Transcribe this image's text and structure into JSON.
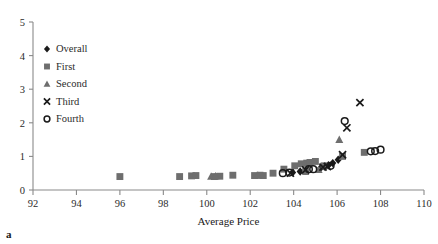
{
  "figure": {
    "panel_label": "a",
    "background_color": "#ffffff"
  },
  "chart_data": {
    "type": "scatter",
    "title": "",
    "xlabel": "Average Price",
    "ylabel": "",
    "xlim": [
      92,
      110
    ],
    "ylim": [
      0,
      5
    ],
    "x_ticks": [
      "92",
      "94",
      "96",
      "98",
      "100",
      "102",
      "104",
      "106",
      "108",
      "110"
    ],
    "x_tick_values": [
      92,
      94,
      96,
      98,
      100,
      102,
      104,
      106,
      108,
      110
    ],
    "y_ticks": [
      "0",
      "1",
      "2",
      "3",
      "4",
      "5"
    ],
    "y_tick_values": [
      0,
      1,
      2,
      3,
      4,
      5
    ],
    "grid": false,
    "legend_position": "upper-left-inside",
    "marker_colors": {
      "overall": "#1a1a1a",
      "first": "#6e6e6e",
      "second": "#6e6e6e",
      "third": "#1a1a1a",
      "fourth": "#1a1a1a"
    },
    "series": [
      {
        "name": "Overall",
        "marker": "diamond",
        "color": "#1a1a1a",
        "points": [
          [
            103.95,
            0.52
          ],
          [
            104.3,
            0.55
          ],
          [
            104.55,
            0.58
          ],
          [
            105.25,
            0.66
          ],
          [
            105.45,
            0.7
          ],
          [
            105.6,
            0.74
          ],
          [
            105.8,
            0.8
          ],
          [
            106.05,
            0.9
          ]
        ]
      },
      {
        "name": "First",
        "marker": "square",
        "color": "#6e6e6e",
        "points": [
          [
            96.0,
            0.4
          ],
          [
            98.75,
            0.4
          ],
          [
            99.3,
            0.42
          ],
          [
            99.5,
            0.43
          ],
          [
            100.35,
            0.4
          ],
          [
            100.6,
            0.41
          ],
          [
            101.2,
            0.44
          ],
          [
            102.2,
            0.43
          ],
          [
            102.45,
            0.44
          ],
          [
            102.6,
            0.43
          ],
          [
            103.05,
            0.5
          ],
          [
            103.55,
            0.62
          ],
          [
            104.05,
            0.72
          ],
          [
            104.35,
            0.78
          ],
          [
            104.6,
            0.8
          ],
          [
            104.75,
            0.82
          ],
          [
            104.55,
            0.55
          ],
          [
            105.0,
            0.85
          ],
          [
            105.4,
            0.72
          ],
          [
            106.25,
            1.0
          ],
          [
            107.25,
            1.12
          ]
        ]
      },
      {
        "name": "Second",
        "marker": "triangle",
        "color": "#6e6e6e",
        "points": [
          [
            100.2,
            0.4
          ],
          [
            100.4,
            0.41
          ],
          [
            102.35,
            0.43
          ],
          [
            105.15,
            0.6
          ],
          [
            106.1,
            1.5
          ]
        ]
      },
      {
        "name": "Third",
        "marker": "cross",
        "color": "#1a1a1a",
        "points": [
          [
            103.85,
            0.5
          ],
          [
            104.55,
            0.6
          ],
          [
            105.35,
            0.68
          ],
          [
            105.55,
            0.7
          ],
          [
            106.25,
            1.05
          ],
          [
            106.45,
            1.85
          ],
          [
            107.05,
            2.6
          ]
        ]
      },
      {
        "name": "Fourth",
        "marker": "circle-open",
        "color": "#1a1a1a",
        "points": [
          [
            103.5,
            0.5
          ],
          [
            103.8,
            0.52
          ],
          [
            104.7,
            0.62
          ],
          [
            104.9,
            0.62
          ],
          [
            105.7,
            0.72
          ],
          [
            106.35,
            2.05
          ],
          [
            107.55,
            1.15
          ],
          [
            107.75,
            1.16
          ],
          [
            108.0,
            1.2
          ]
        ]
      }
    ],
    "legend_entries": [
      {
        "label": "Overall",
        "marker": "diamond",
        "color": "#1a1a1a"
      },
      {
        "label": "First",
        "marker": "square",
        "color": "#6e6e6e"
      },
      {
        "label": "Second",
        "marker": "triangle",
        "color": "#6e6e6e"
      },
      {
        "label": "Third",
        "marker": "cross",
        "color": "#1a1a1a"
      },
      {
        "label": "Fourth",
        "marker": "circle-open",
        "color": "#1a1a1a"
      }
    ]
  }
}
